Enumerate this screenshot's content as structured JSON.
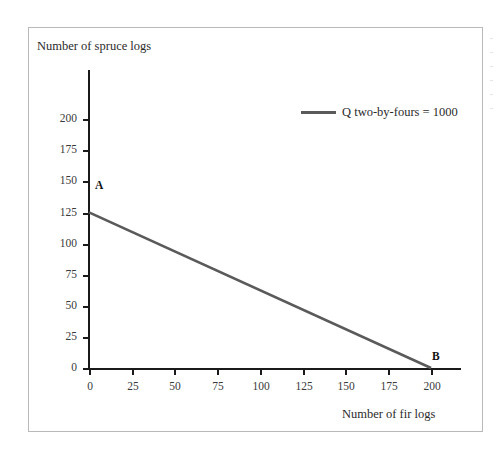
{
  "chart_data": {
    "type": "line",
    "title": "",
    "xlabel": "Number of fir logs",
    "ylabel": "Number of spruce logs",
    "xlim": [
      0,
      215
    ],
    "ylim": [
      0,
      215
    ],
    "xticks": [
      0,
      25,
      50,
      75,
      100,
      125,
      150,
      175,
      200
    ],
    "yticks": [
      0,
      25,
      50,
      75,
      100,
      125,
      150,
      175,
      200
    ],
    "grid": false,
    "legend_position": "top-right",
    "series": [
      {
        "name": "Q two-by-fours = 1000",
        "color": "#5a5a5a",
        "x": [
          0,
          200
        ],
        "values": [
          125,
          0
        ]
      }
    ],
    "annotations": [
      {
        "label": "A",
        "x": 0,
        "y": 125
      },
      {
        "label": "B",
        "x": 200,
        "y": 0
      }
    ]
  },
  "axes": {
    "y_title": "Number of spruce logs",
    "x_title": "Number of fir logs",
    "y_tick_labels": [
      "200",
      "175",
      "150",
      "125",
      "100",
      "75",
      "50",
      "25",
      "0"
    ],
    "x_tick_labels": [
      "0",
      "25",
      "50",
      "75",
      "100",
      "125",
      "150",
      "175",
      "200"
    ]
  },
  "legend": {
    "entries": [
      {
        "label": "Q two-by-fours = 1000",
        "color": "#5a5a5a"
      }
    ]
  },
  "points": {
    "a_label": "A",
    "b_label": "B"
  },
  "colors": {
    "line": "#5a5a5a",
    "axis": "#1a1a1a",
    "frame": "#b9b9b9",
    "text": "#2b2b2b"
  }
}
